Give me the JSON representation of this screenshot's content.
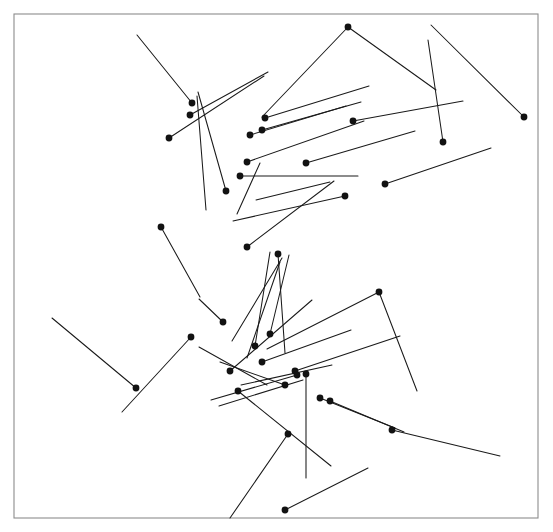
{
  "figure": {
    "title": "",
    "kind": "vector-field-needle-plot",
    "width": 553,
    "height": 532,
    "background_color": "#ffffff",
    "line_color": "#1a1a1a",
    "dot_color": "#121212",
    "frame_color": "#8c8c8c",
    "frame": {
      "x": 14,
      "y": 14,
      "width": 524,
      "height": 504
    },
    "dot_radius": 3.4,
    "line_width": 1.05
  },
  "chart_data": {
    "type": "scatter",
    "title": "",
    "xlabel": "",
    "ylabel": "",
    "grid": false,
    "legend": null,
    "xlim": [
      14,
      538
    ],
    "ylim": [
      14,
      518
    ],
    "count": 47,
    "series": [
      {
        "name": "needles",
        "fields": [
          "x0",
          "y0",
          "x1",
          "y1",
          "has_dot"
        ],
        "values": [
          [
            192.0,
            103.0,
            137.0,
            35.0,
            true
          ],
          [
            190.0,
            115.0,
            268.0,
            72.0,
            true
          ],
          [
            169.0,
            138.0,
            264.0,
            76.0,
            true
          ],
          [
            226.0,
            191.0,
            198.0,
            92.0,
            true
          ],
          [
            206.0,
            210.0,
            197.0,
            96.0,
            false
          ],
          [
            348.0,
            27.0,
            262.0,
            117.0,
            true
          ],
          [
            348.0,
            27.0,
            436.0,
            90.0,
            false
          ],
          [
            265.0,
            118.0,
            369.0,
            86.0,
            true
          ],
          [
            262.0,
            130.0,
            361.0,
            102.0,
            true
          ],
          [
            250.0,
            135.0,
            346.0,
            106.0,
            true
          ],
          [
            247.0,
            162.0,
            364.0,
            121.0,
            true
          ],
          [
            240.0,
            176.0,
            358.0,
            176.0,
            true
          ],
          [
            353.0,
            121.0,
            463.0,
            101.0,
            true
          ],
          [
            306.0,
            163.0,
            415.0,
            131.0,
            true
          ],
          [
            443.0,
            142.0,
            428.0,
            40.0,
            true
          ],
          [
            524.0,
            117.0,
            431.0,
            25.0,
            true
          ],
          [
            385.0,
            184.0,
            491.0,
            148.0,
            true
          ],
          [
            345.0,
            196.0,
            233.0,
            221.0,
            true
          ],
          [
            247.0,
            247.0,
            334.0,
            181.0,
            true
          ],
          [
            278.0,
            254.0,
            285.0,
            353.0,
            true
          ],
          [
            282.0,
            258.0,
            232.0,
            341.0,
            false
          ],
          [
            161.0,
            227.0,
            200.0,
            297.0,
            true
          ],
          [
            223.0,
            322.0,
            199.0,
            299.0,
            true
          ],
          [
            191.0,
            337.0,
            122.0,
            412.0,
            true
          ],
          [
            136.0,
            388.0,
            52.0,
            318.0,
            true
          ],
          [
            255.0,
            346.0,
            270.0,
            252.0,
            true
          ],
          [
            270.0,
            334.0,
            289.0,
            255.0,
            true
          ],
          [
            247.0,
            358.0,
            280.0,
            262.0,
            false
          ],
          [
            230.0,
            371.0,
            312.0,
            300.0,
            true
          ],
          [
            379.0,
            292.0,
            267.0,
            349.0,
            true
          ],
          [
            379.0,
            292.0,
            417.0,
            391.0,
            false
          ],
          [
            262.0,
            362.0,
            351.0,
            330.0,
            true
          ],
          [
            295.0,
            371.0,
            400.0,
            336.0,
            true
          ],
          [
            285.0,
            385.0,
            220.0,
            362.0,
            true
          ],
          [
            241.0,
            385.0,
            332.0,
            365.0,
            false
          ],
          [
            297.0,
            375.0,
            211.0,
            400.0,
            true
          ],
          [
            303.0,
            380.0,
            219.0,
            406.0,
            false
          ],
          [
            238.0,
            391.0,
            331.0,
            466.0,
            true
          ],
          [
            306.0,
            374.0,
            306.0,
            478.0,
            true
          ],
          [
            320.0,
            398.0,
            395.0,
            428.0,
            true
          ],
          [
            330.0,
            401.0,
            404.0,
            432.0,
            true
          ],
          [
            288.0,
            434.0,
            230.0,
            518.0,
            true
          ],
          [
            285.0,
            510.0,
            368.0,
            468.0,
            true
          ],
          [
            392.0,
            430.0,
            500.0,
            456.0,
            true
          ],
          [
            267.0,
            385.0,
            199.0,
            347.0,
            false
          ],
          [
            237.0,
            214.0,
            260.0,
            163.0,
            false
          ],
          [
            256.0,
            200.0,
            330.0,
            182.0,
            false
          ]
        ]
      }
    ]
  }
}
